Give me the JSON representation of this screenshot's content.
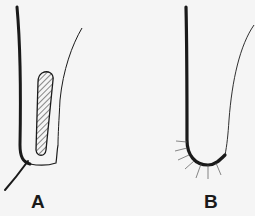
{
  "figure": {
    "panels": [
      {
        "id": "A",
        "label": "A",
        "description": "Structure with thick outer wall, thin inner wall, hatched elongated capsule and tail strand"
      },
      {
        "id": "B",
        "label": "B",
        "description": "U-shaped structure with thick wall and radiating bristles at the base"
      }
    ],
    "colors": {
      "ink": "#1a1a1a",
      "background": "#f5f5f5"
    }
  }
}
